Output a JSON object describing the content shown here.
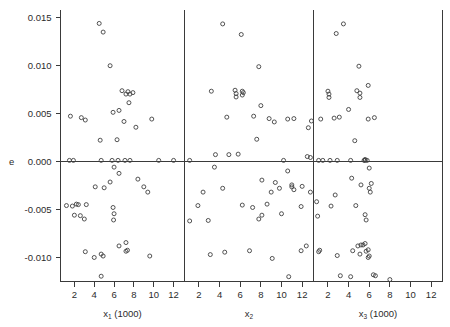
{
  "figure": {
    "kind": "residual-scatter-panels",
    "background": "#ffffff",
    "ink": "#3a3a3a",
    "point_color": "#404040",
    "ylabel": "e"
  },
  "chart_data": {
    "type": "scatter",
    "title": "",
    "ylabel": "e",
    "xlabel": "",
    "ylim": [
      -0.0125,
      0.0158
    ],
    "yticks": [
      0.015,
      0.01,
      0.005,
      0.0,
      -0.005,
      -0.01
    ],
    "ytick_labels": [
      "0.015",
      "0.010",
      "0.005",
      "0.000",
      "-0.005",
      "-0.010"
    ],
    "grid": false,
    "legend": "none",
    "zero_reference_line": 0.0,
    "panels": [
      {
        "name": "panel-x1",
        "xlabel": "x",
        "xlabel_sub": "1",
        "xlabel_unit": "(1000)",
        "xlim": [
          0.6,
          13.1
        ],
        "xticks": [
          2,
          4,
          6,
          8,
          10,
          12
        ],
        "xtick_labels": [
          "2",
          "4",
          "6",
          "8",
          "10",
          "12"
        ],
        "x": [
          4.5,
          4.9,
          5.6,
          6.8,
          7.2,
          7.4,
          7.6,
          7.9,
          7.5,
          1.6,
          2.7,
          3.1,
          4.6,
          5.9,
          6.3,
          7.0,
          6.5,
          8.2,
          9.8,
          10.5,
          4.7,
          5.8,
          6.4,
          6.0,
          7.1,
          7.6,
          12.0,
          1.5,
          1.9,
          2.2,
          3.2,
          4.1,
          2.0,
          2.6,
          3.0,
          5.6,
          6.5,
          5.0,
          8.4,
          9.0,
          9.4,
          5.9,
          6.0,
          5.95,
          3.1,
          6.5,
          7.2,
          1.2,
          1.8,
          2.4,
          4.7,
          7.2,
          7.35,
          9.6,
          4.0,
          4.7,
          4.9
        ],
        "y": [
          0.01435,
          0.01345,
          0.00995,
          0.00735,
          0.007,
          0.00725,
          0.007,
          0.00715,
          0.0061,
          0.0047,
          0.00455,
          0.0043,
          0.0022,
          0.0051,
          0.00225,
          0.00415,
          0.0053,
          0.00355,
          0.0044,
          0.0001,
          0.0001,
          0.0001,
          0.0001,
          -0.0006,
          0.0001,
          0.0001,
          0.0001,
          0.0001,
          0.0001,
          -0.00445,
          -0.0045,
          -0.00265,
          -0.0056,
          -0.00565,
          -0.006,
          -0.00215,
          -0.00125,
          -0.00275,
          -0.00185,
          -0.00265,
          -0.0032,
          -0.0048,
          -0.00545,
          -0.0061,
          -0.0094,
          -0.0088,
          -0.00845,
          -0.0046,
          -0.00465,
          -0.0045,
          -0.01195,
          -0.00935,
          -0.00925,
          -0.00985,
          -0.01,
          -0.00965,
          -0.00985
        ]
      },
      {
        "name": "panel-x2",
        "xlabel": "x",
        "xlabel_sub": "2",
        "xlabel_unit": "",
        "xlim": [
          0.6,
          13.1
        ],
        "xticks": [
          2,
          4,
          6,
          8,
          10,
          12
        ],
        "xtick_labels": [
          "2",
          "4",
          "6",
          "8",
          "10",
          "12"
        ],
        "x": [
          4.3,
          6.1,
          7.8,
          5.5,
          5.6,
          5.6,
          3.2,
          6.2,
          6.2,
          6.3,
          4.7,
          7.3,
          8.0,
          8.8,
          9.3,
          10.6,
          7.6,
          11.2,
          12.6,
          12.9,
          1.1,
          3.6,
          4.9,
          5.8,
          10.2,
          12.5,
          12.8,
          3.5,
          10.6,
          8.1,
          4.3,
          9.4,
          11.0,
          11.0,
          9.8,
          2.4,
          12.0,
          12.8,
          1.9,
          9.0,
          11.2,
          2.9,
          8.1,
          10.0,
          1.1,
          8.6,
          11.9,
          6.2,
          7.2,
          7.8,
          6.9,
          4.5,
          3.1,
          11.9,
          12.4,
          9.1,
          10.7
        ],
        "y": [
          0.0143,
          0.0132,
          0.00985,
          0.0074,
          0.00705,
          0.0067,
          0.0073,
          0.0073,
          0.0069,
          0.00715,
          0.0046,
          0.0047,
          0.0058,
          0.00445,
          0.0041,
          0.0044,
          0.0023,
          0.00445,
          0.0035,
          0.0042,
          0.0001,
          0.0007,
          0.0007,
          0.00075,
          0.0001,
          0.0005,
          0.0004,
          -0.0006,
          -0.001,
          -0.00195,
          -0.0028,
          -0.0022,
          -0.00245,
          -0.00265,
          -0.0028,
          -0.0032,
          -0.0026,
          -0.0032,
          -0.0046,
          -0.0032,
          -0.00295,
          -0.00615,
          -0.0056,
          -0.00545,
          -0.0062,
          -0.00445,
          -0.0047,
          -0.00455,
          -0.0048,
          -0.006,
          -0.0093,
          -0.00945,
          -0.0097,
          -0.0093,
          -0.0088,
          -0.0101,
          -0.012
        ]
      },
      {
        "name": "panel-x3",
        "xlabel": "x",
        "xlabel_sub": "3",
        "xlabel_unit": "(1000)",
        "xlim": [
          0.6,
          13.1
        ],
        "xticks": [
          2,
          4,
          6,
          8,
          10,
          12
        ],
        "xtick_labels": [
          "2",
          "4",
          "6",
          "8",
          "10",
          "12"
        ],
        "x": [
          3.5,
          2.8,
          5.0,
          2.0,
          2.1,
          2.1,
          4.8,
          5.9,
          3.1,
          6.5,
          1.3,
          2.6,
          4.0,
          5.1,
          5.1,
          5.9,
          4.6,
          1.1,
          2.2,
          5.6,
          5.6,
          6.0,
          1.5,
          2.9,
          4.2,
          5.5,
          5.8,
          4.3,
          0.9,
          1.0,
          2.7,
          5.2,
          6.0,
          6.1,
          6.2,
          4.7,
          2.3,
          5.6,
          5.7,
          1.2,
          4.4,
          5.2,
          5.6,
          2.9,
          5.1,
          5.7,
          5.9,
          1.1,
          4.9,
          5.4,
          8.0,
          5.9,
          6.0,
          4.2,
          3.2,
          6.4,
          6.6
        ],
        "y": [
          0.0143,
          0.0133,
          0.0099,
          0.0073,
          0.007,
          0.00665,
          0.00735,
          0.0079,
          0.0046,
          0.00455,
          0.0044,
          0.0045,
          0.0054,
          0.0071,
          0.00665,
          0.0044,
          0.00215,
          0.0001,
          0.0001,
          0.0002,
          0.0001,
          -0.0007,
          0.0001,
          0.0001,
          0.0001,
          0.0001,
          0.0001,
          -0.00175,
          -0.0042,
          -0.0057,
          -0.0035,
          -0.00245,
          -0.0028,
          -0.0032,
          -0.0023,
          -0.0046,
          -0.00465,
          -0.00555,
          -0.0061,
          -0.00925,
          -0.0093,
          -0.0087,
          -0.00855,
          -0.0098,
          -0.00965,
          -0.00935,
          -0.0092,
          -0.0094,
          -0.0088,
          -0.0087,
          -0.0123,
          -0.01,
          -0.00985,
          -0.012,
          -0.0119,
          -0.0118,
          -0.0119
        ]
      }
    ]
  }
}
